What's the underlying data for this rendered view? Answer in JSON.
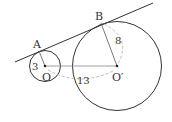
{
  "diagram": {
    "type": "two circles with common external tangent",
    "points": {
      "A": "A",
      "B": "B",
      "O": "O",
      "O_prime": "O′"
    },
    "measurements": {
      "radius_small": "3",
      "radius_large": "8",
      "center_distance": "13"
    },
    "colors": {
      "stroke": "#333333",
      "dashed": "#999999"
    }
  }
}
